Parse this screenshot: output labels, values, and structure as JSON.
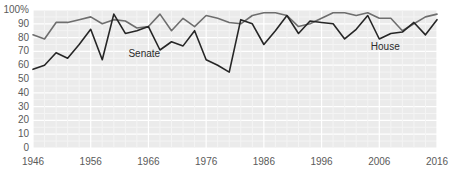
{
  "chart_data": {
    "type": "line",
    "title": "",
    "subtitle": "",
    "xlabel": "",
    "ylabel": "",
    "xlim": [
      1946,
      2016
    ],
    "ylim": [
      0,
      100
    ],
    "grid": true,
    "legend_position": "inline-annotations",
    "y_ticks": [
      "100%",
      "90",
      "80",
      "70",
      "60",
      "50",
      "40",
      "30",
      "20",
      "10",
      "0"
    ],
    "y_tick_values": [
      100,
      90,
      80,
      70,
      60,
      50,
      40,
      30,
      20,
      10,
      0
    ],
    "x_ticks": [
      "1946",
      "1956",
      "1966",
      "1976",
      "1986",
      "1996",
      "2006",
      "2016"
    ],
    "x_tick_values": [
      1946,
      1956,
      1966,
      1976,
      1986,
      1996,
      2006,
      2016
    ],
    "x": [
      1946,
      1948,
      1950,
      1952,
      1954,
      1956,
      1958,
      1960,
      1962,
      1964,
      1966,
      1968,
      1970,
      1972,
      1974,
      1976,
      1978,
      1980,
      1982,
      1984,
      1986,
      1988,
      1990,
      1992,
      1994,
      1996,
      1998,
      2000,
      2002,
      2004,
      2006,
      2008,
      2010,
      2012,
      2014,
      2016
    ],
    "series": [
      {
        "name": "House",
        "color": "#6e6e6e",
        "values": [
          82,
          79,
          91,
          91,
          93,
          95,
          90,
          93,
          92,
          87,
          88,
          97,
          85,
          94,
          88,
          96,
          94,
          91,
          90,
          96,
          98,
          98,
          96,
          88,
          90,
          94,
          98,
          98,
          96,
          98,
          94,
          94,
          85,
          90,
          95,
          97
        ]
      },
      {
        "name": "Senate",
        "color": "#262626",
        "values": [
          57,
          60,
          69,
          65,
          75,
          86,
          64,
          97,
          83,
          85,
          88,
          71,
          77,
          74,
          85,
          64,
          60,
          55,
          93,
          90,
          75,
          85,
          96,
          83,
          92,
          91,
          90,
          79,
          86,
          96,
          79,
          83,
          84,
          91,
          82,
          93
        ]
      }
    ],
    "annotations": [
      {
        "text": "Senate",
        "x": 1966,
        "y": 68
      },
      {
        "text": "House",
        "x": 2008,
        "y": 73
      }
    ],
    "colors": {
      "plot_background": "#ebebeb",
      "gridline": "#ffffff",
      "page_background": "#ffffff",
      "tick_label": "#5a5a5a",
      "house_line": "#6e6e6e",
      "senate_line": "#262626"
    },
    "geometry": {
      "plot_left": 33,
      "plot_right": 437,
      "plot_top": 10,
      "plot_bottom": 148
    }
  }
}
